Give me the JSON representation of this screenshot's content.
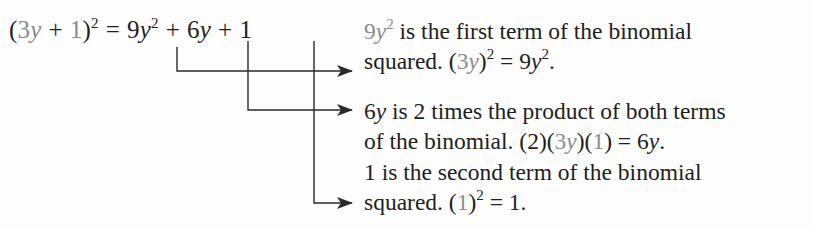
{
  "equation": {
    "lhs": {
      "open_paren": "(",
      "term1": "3",
      "term1_var": "y",
      "plus": "+",
      "term2": "1",
      "close_paren": ")",
      "exponent": "2"
    },
    "equals": "=",
    "rhs": {
      "t1_coef": "9",
      "t1_var": "y",
      "t1_exp": "2",
      "plus1": "+",
      "t2_coef": "6",
      "t2_var": "y",
      "plus2": "+",
      "t3": "1"
    }
  },
  "annotations": [
    {
      "target": "9y²",
      "line1": {
        "lead_coef": "9",
        "lead_var": "y",
        "lead_exp": "2",
        "text": " is the first term of the binomial"
      },
      "line2": {
        "text": "squared. ",
        "expr_open": "(",
        "expr_coef": "3",
        "expr_var": "y",
        "expr_close": ")",
        "expr_exp": "2",
        "equals": " = 9",
        "result_var": "y",
        "result_exp": "2",
        "end": "."
      }
    },
    {
      "target": "6y",
      "line1": {
        "lead_coef": "6",
        "lead_var": "y",
        "text": " is 2 times the product of both terms"
      },
      "line2": {
        "text": "of the binomial. (2)(",
        "expr_coef": "3",
        "expr_var": "y",
        "mid": ")(",
        "expr_term": "1",
        "end_paren": ")",
        "equals": " = 6",
        "result_var": "y",
        "end": "."
      }
    },
    {
      "target": "1",
      "line1": {
        "text": "1 is the second term of the binomial"
      },
      "line2": {
        "text": "squared. (",
        "expr_term": "1",
        "expr_close": ")",
        "expr_exp": "2",
        "equals": " = 1."
      }
    }
  ],
  "colors": {
    "text": "#1e1e1e",
    "highlight_grey": "#8c8c8c",
    "background": "#fdfdfd",
    "arrow": "#2a2a2a"
  }
}
